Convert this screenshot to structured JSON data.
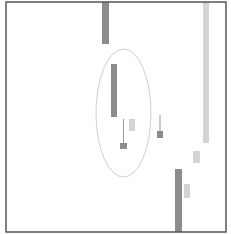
{
  "chart_data": {
    "type": "candlestick",
    "title": "",
    "xlabel": "",
    "ylabel": "",
    "grid": false,
    "legend": null,
    "frame": {
      "x": 6,
      "y": 2,
      "width": 220,
      "height": 230,
      "stroke": "#555555"
    },
    "colors": {
      "down": "#8c8c8c",
      "up": "#d4d4d4",
      "wick": "#9a9a9a",
      "annotation": "#cfcfcf"
    },
    "candles": [
      {
        "index": 0,
        "x": 102,
        "width": 7,
        "top": 2,
        "bottom": 44,
        "color": "down"
      },
      {
        "index": 1,
        "x": 111,
        "width": 6,
        "top": 64,
        "bottom": 117,
        "color": "down"
      },
      {
        "index": 2,
        "x": 120,
        "width": 7,
        "top": 143,
        "bottom": 149,
        "wick_top": 119,
        "wick_bottom": 143,
        "color": "down"
      },
      {
        "index": 3,
        "x": 129,
        "width": 6,
        "top": 119,
        "bottom": 131,
        "color": "up"
      },
      {
        "index": 4,
        "x": 157,
        "width": 6,
        "top": 131,
        "bottom": 138,
        "wick_top": 115,
        "wick_bottom": 131,
        "color": "down"
      },
      {
        "index": 5,
        "x": 175,
        "width": 7,
        "top": 169,
        "bottom": 232,
        "color": "down"
      },
      {
        "index": 6,
        "x": 184,
        "width": 6,
        "top": 184,
        "bottom": 198,
        "color": "up"
      },
      {
        "index": 7,
        "x": 193,
        "width": 7,
        "top": 151,
        "bottom": 163,
        "color": "up"
      },
      {
        "index": 8,
        "x": 203,
        "width": 6,
        "top": 2,
        "bottom": 143,
        "color": "up"
      }
    ],
    "annotations": [
      {
        "type": "ellipse",
        "cx": 123.5,
        "cy": 113,
        "rx": 27.5,
        "ry": 64
      }
    ]
  }
}
